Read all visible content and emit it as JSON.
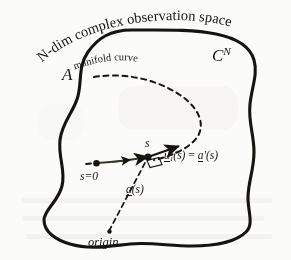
{
  "figure": {
    "type": "diagram",
    "caption_absent": true,
    "background_color": "#fbfbf9",
    "ink_color": "#16140f"
  },
  "labels": {
    "space_title": "N-dim complex observation space",
    "manifold_curve": "manifold curve",
    "manifold_symbol": "A",
    "complex_space_symbol": "C",
    "complex_space_exponent": "N",
    "arc_start": "s=0",
    "arc_param": "s",
    "tangent_u": "u",
    "tangent_u_subscript": "1",
    "tangent_arg": "(s)",
    "equals": "=",
    "tangent_a": "a",
    "tangent_a_prime": "'(s)",
    "position_vector": "a",
    "position_vector_arg": "(s)",
    "origin": "origin"
  },
  "geometry": {
    "blob_outline": "M 132 30 C 110 30 98 38 88 52 C 78 66 82 80 78 96 C 74 112 62 122 60 140 C 58 158 66 170 62 186 C 58 202 44 210 44 220 C 44 232 56 240 70 244 C 90 250 110 246 130 244 C 150 242 170 246 192 246 C 214 246 236 242 246 232 C 254 224 248 212 248 198 C 248 182 254 170 254 152 C 254 134 248 122 250 104 C 252 86 258 74 254 60 C 250 46 236 38 216 34 C 192 29 162 30 132 30 Z",
    "manifold_dashed_curve": "M 96 76 C 130 74 160 82 182 96 C 202 109 208 126 196 140 C 186 152 168 158 152 162",
    "solid_arc": "M 96 163 C 112 162 130 160 148 157",
    "position_vector_line": "M 108 232 L 148 157",
    "tangent_arrow": "M 148 157 L 180 146",
    "start_point": {
      "cx": 96,
      "cy": 163,
      "r": 3.2
    },
    "tangent_point": {
      "cx": 148,
      "cy": 157,
      "r": 3.4
    },
    "origin_point": {
      "cx": 108,
      "cy": 232,
      "r": 2.2
    }
  }
}
